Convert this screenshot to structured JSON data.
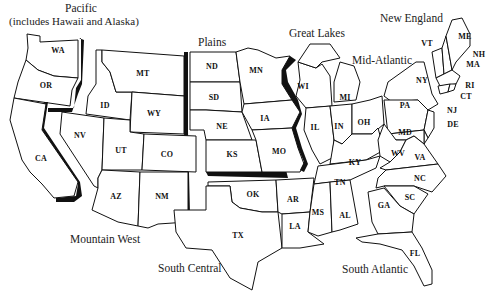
{
  "map": {
    "title": "U.S. Census-style regions map",
    "regions": {
      "pacific": {
        "label": "Pacific",
        "sub": "(includes Hawaii and Alaska)",
        "states": [
          "WA",
          "OR",
          "CA"
        ]
      },
      "mountain_west": {
        "label": "Mountain West",
        "states": [
          "MT",
          "ID",
          "WY",
          "NV",
          "UT",
          "CO",
          "AZ",
          "NM"
        ]
      },
      "plains": {
        "label": "Plains",
        "states": [
          "ND",
          "SD",
          "NE",
          "KS",
          "MN",
          "IA",
          "MO"
        ]
      },
      "great_lakes": {
        "label": "Great Lakes",
        "states": [
          "WI",
          "MI",
          "IL",
          "IN",
          "OH"
        ]
      },
      "south_central": {
        "label": "South Central",
        "states": [
          "OK",
          "TX",
          "AR",
          "LA",
          "KY",
          "TN",
          "MS",
          "AL"
        ]
      },
      "mid_atlantic": {
        "label": "Mid-Atlantic",
        "states": [
          "NY",
          "PA",
          "NJ",
          "DE",
          "MD"
        ]
      },
      "new_england": {
        "label": "New England",
        "states": [
          "ME",
          "NH",
          "VT",
          "MA",
          "RI",
          "CT"
        ]
      },
      "south_atlantic": {
        "label": "South Atlantic",
        "states": [
          "WV",
          "VA",
          "NC",
          "SC",
          "GA",
          "FL"
        ]
      }
    },
    "state_labels": {
      "WA": "WA",
      "OR": "OR",
      "CA": "CA",
      "MT": "MT",
      "ID": "ID",
      "WY": "WY",
      "NV": "NV",
      "UT": "UT",
      "CO": "CO",
      "AZ": "AZ",
      "NM": "NM",
      "ND": "ND",
      "SD": "SD",
      "NE": "NE",
      "KS": "KS",
      "MN": "MN",
      "IA": "IA",
      "MO": "MO",
      "WI": "WI",
      "MI": "MI",
      "IL": "IL",
      "IN": "IN",
      "OH": "OH",
      "OK": "OK",
      "TX": "TX",
      "AR": "AR",
      "LA": "LA",
      "KY": "KY",
      "TN": "TN",
      "MS": "MS",
      "AL": "AL",
      "NY": "NY",
      "PA": "PA",
      "NJ": "NJ",
      "DE": "DE",
      "MD": "MD",
      "ME": "ME",
      "NH": "NH",
      "VT": "VT",
      "MA": "MA",
      "RI": "RI",
      "CT": "CT",
      "WV": "WV",
      "VA": "VA",
      "NC": "NC",
      "SC": "SC",
      "GA": "GA",
      "FL": "FL"
    }
  }
}
